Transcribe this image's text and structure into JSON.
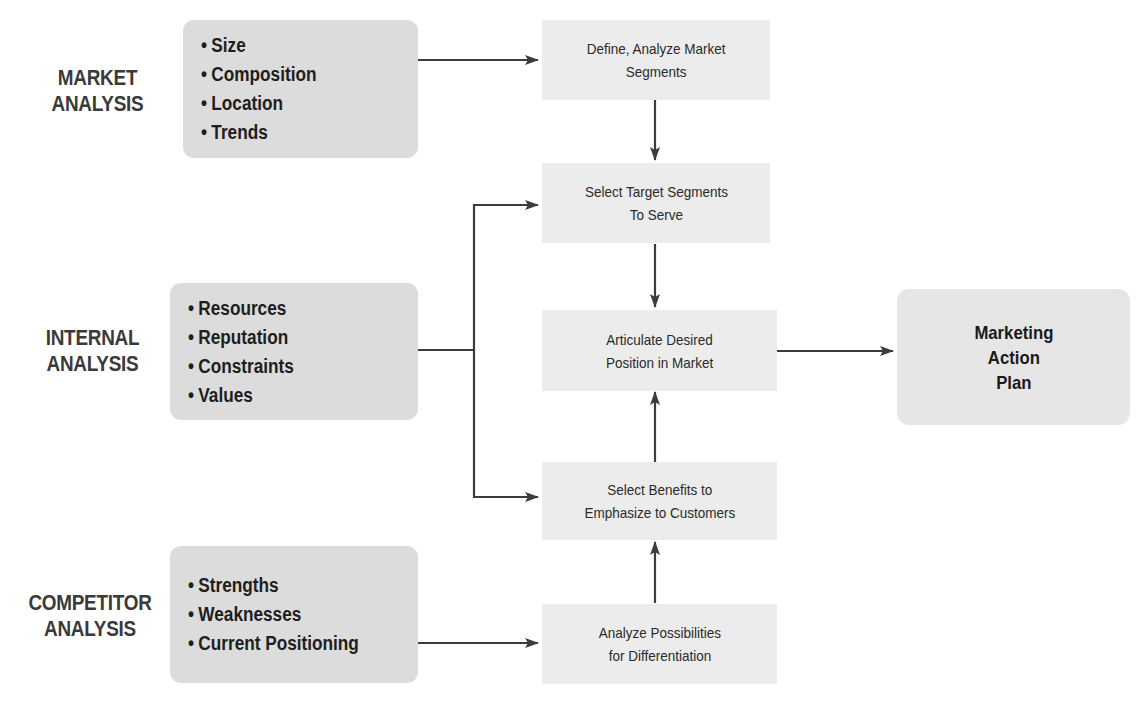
{
  "diagram": {
    "type": "flowchart",
    "colors": {
      "input_box_fill": "#dcdcdc",
      "step_box_fill": "#ececec",
      "plan_box_fill": "#e6e6e6",
      "arrow": "#3c3c3c",
      "label_text": "#3a3a3a"
    },
    "analyses": [
      {
        "id": "market",
        "label_line1": "MARKET",
        "label_line2": "ANALYSIS",
        "items": [
          "Size",
          "Composition",
          "Location",
          "Trends"
        ]
      },
      {
        "id": "internal",
        "label_line1": "INTERNAL",
        "label_line2": "ANALYSIS",
        "items": [
          "Resources",
          "Reputation",
          "Constraints",
          "Values"
        ]
      },
      {
        "id": "competitor",
        "label_line1": "COMPETITOR",
        "label_line2": "ANALYSIS",
        "items": [
          "Strengths",
          "Weaknesses",
          "Current Positioning"
        ]
      }
    ],
    "steps": [
      {
        "id": "define-segments",
        "text": "Define, Analyze Market\nSegments"
      },
      {
        "id": "select-target",
        "text": "Select Target Segments\nTo Serve"
      },
      {
        "id": "articulate-position",
        "text": "Articulate Desired\nPosition in Market"
      },
      {
        "id": "select-benefits",
        "text": "Select Benefits to\nEmphasize to Customers"
      },
      {
        "id": "analyze-differentiation",
        "text": "Analyze Possibilities\nfor Differentiation"
      }
    ],
    "outcome": {
      "id": "marketing-action-plan",
      "text": "Marketing\nAction\nPlan"
    },
    "edges": [
      {
        "from": "market",
        "to": "define-segments"
      },
      {
        "from": "define-segments",
        "to": "select-target"
      },
      {
        "from": "internal",
        "to": "select-target"
      },
      {
        "from": "internal",
        "to": "select-benefits"
      },
      {
        "from": "select-target",
        "to": "articulate-position"
      },
      {
        "from": "select-benefits",
        "to": "articulate-position"
      },
      {
        "from": "analyze-differentiation",
        "to": "select-benefits"
      },
      {
        "from": "competitor",
        "to": "analyze-differentiation"
      },
      {
        "from": "articulate-position",
        "to": "marketing-action-plan"
      }
    ]
  }
}
